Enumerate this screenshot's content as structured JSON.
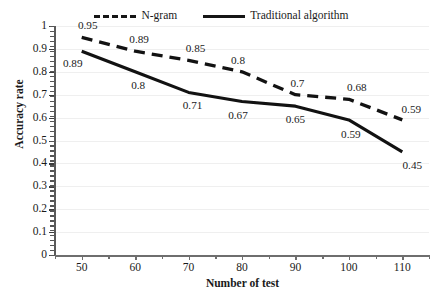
{
  "chart_data": {
    "type": "line",
    "title": "",
    "xlabel": "Number of test",
    "ylabel": "Accuracy rate",
    "x": [
      50,
      60,
      70,
      80,
      90,
      100,
      110
    ],
    "xlim": [
      45,
      115
    ],
    "ylim": [
      0,
      1
    ],
    "xticks": [
      "50",
      "60",
      "70",
      "80",
      "90",
      "100",
      "110"
    ],
    "yticks": [
      "0",
      "0.1",
      "0.2",
      "0.3",
      "0.4",
      "0.5",
      "0.6",
      "0.7",
      "0.8",
      "0.9",
      "1"
    ],
    "grid": "horizontal",
    "legend_position": "top-center",
    "series": [
      {
        "name": "N-gram",
        "style": "dashed",
        "color": "#121212",
        "values": [
          0.95,
          0.89,
          0.85,
          0.8,
          0.7,
          0.68,
          0.59
        ],
        "labels": [
          "0.95",
          "0.89",
          "0.85",
          "0.8",
          "0.7",
          "0.68",
          "0.59"
        ]
      },
      {
        "name": "Traditional algorithm",
        "style": "solid",
        "color": "#121212",
        "values": [
          0.89,
          0.8,
          0.71,
          0.67,
          0.65,
          0.59,
          0.45
        ],
        "labels": [
          "0.89",
          "0.8",
          "0.71",
          "0.67",
          "0.65",
          "0.59",
          "0.45"
        ]
      }
    ]
  },
  "legend": {
    "entries": [
      {
        "label": "N-gram",
        "style": "dashed"
      },
      {
        "label": "Traditional algorithm",
        "style": "solid"
      }
    ]
  },
  "axes": {
    "y_title": "Accuracy rate",
    "x_title": "Number of test"
  },
  "caption": {
    "text": ""
  }
}
